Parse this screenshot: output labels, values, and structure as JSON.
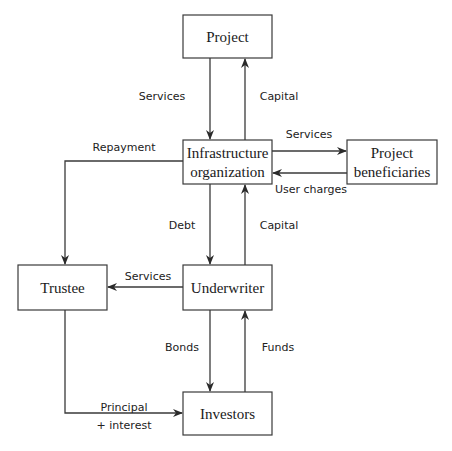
{
  "nodes": {
    "project": {
      "label": "Project"
    },
    "infra": {
      "line1": "Infrastructure",
      "line2": "organization"
    },
    "beneficiaries": {
      "line1": "Project",
      "line2": "beneficiaries"
    },
    "trustee": {
      "label": "Trustee"
    },
    "underwriter": {
      "label": "Underwriter"
    },
    "investors": {
      "label": "Investors"
    }
  },
  "edges": {
    "project_to_infra": "Services",
    "infra_to_project": "Capital",
    "infra_to_beneficiaries": "Services",
    "beneficiaries_to_infra": "User charges",
    "infra_to_trustee": "Repayment",
    "infra_to_underwriter": "Debt",
    "underwriter_to_infra": "Capital",
    "underwriter_to_trustee": "Services",
    "underwriter_to_investors": "Bonds",
    "investors_to_underwriter": "Funds",
    "trustee_to_investors_line1": "Principal",
    "trustee_to_investors_line2": "+ interest"
  }
}
